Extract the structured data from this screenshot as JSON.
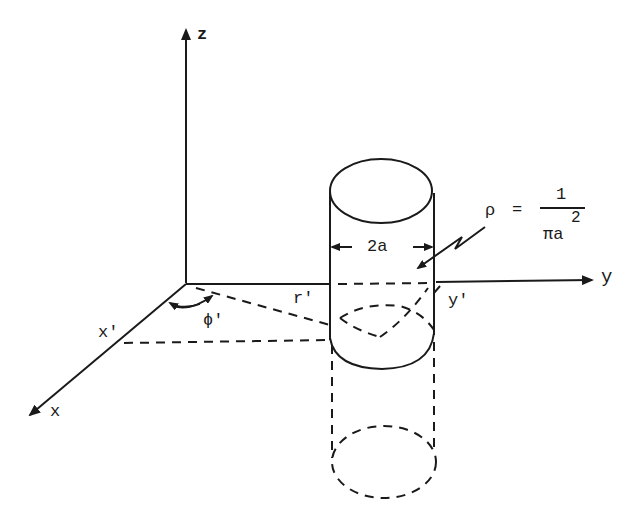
{
  "diagram": {
    "type": "3d-coordinate-geometry",
    "axes": {
      "z_label": "z",
      "y_label": "y",
      "x_label": "x"
    },
    "point_labels": {
      "x_prime": "x'",
      "y_prime": "y'",
      "r_prime": "r'",
      "phi_prime": "ϕ'"
    },
    "cylinder": {
      "width_label": "2a"
    },
    "density": {
      "symbol": "ρ",
      "equals": "=",
      "numerator": "1",
      "denominator": "πa",
      "exponent": "2"
    },
    "colors": {
      "ink": "#1a1a1a",
      "background": "#ffffff"
    }
  }
}
